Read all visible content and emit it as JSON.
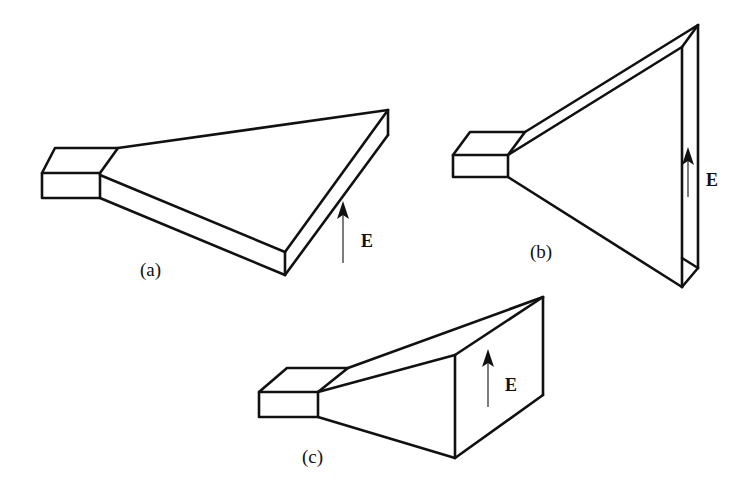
{
  "figure": {
    "panels": [
      {
        "id": "a",
        "label": "(a)",
        "type": "H-plane sectoral horn",
        "field_label": "E"
      },
      {
        "id": "b",
        "label": "(b)",
        "type": "E-plane sectoral horn",
        "field_label": "E"
      },
      {
        "id": "c",
        "label": "(c)",
        "type": "Pyramidal horn",
        "field_label": "E"
      }
    ]
  }
}
